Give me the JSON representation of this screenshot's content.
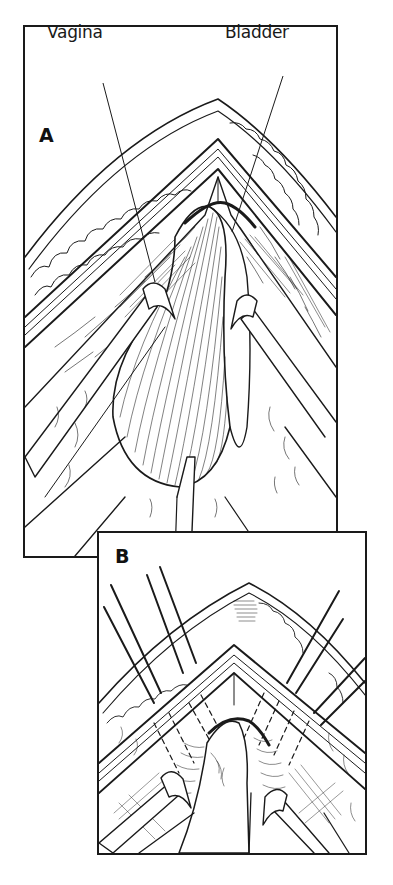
{
  "figure": {
    "panels": [
      {
        "id": "A",
        "letter": "A",
        "labels": [
          {
            "text": "Vagina",
            "points_to": "vagina"
          },
          {
            "text": "Bladder",
            "points_to": "bladder"
          }
        ]
      },
      {
        "id": "B",
        "letter": "B",
        "labels": []
      }
    ]
  },
  "colors": {
    "ink": "#1a1a1a",
    "paper": "#ffffff"
  }
}
